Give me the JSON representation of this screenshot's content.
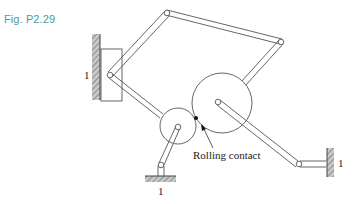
{
  "figure": {
    "caption": "Fig. P2.29",
    "caption_color": "#4a9a9a"
  },
  "labels": {
    "ground_left": "1",
    "ground_bottom": "1",
    "ground_right": "1",
    "rolling_contact": "Rolling contact"
  },
  "components": {
    "ground_links": [
      "left wall",
      "bottom base",
      "right wall"
    ],
    "slider": "rectangular slider on left wall",
    "wheels": [
      "small wheel",
      "large wheel"
    ],
    "contact": "rolling contact between wheels"
  }
}
